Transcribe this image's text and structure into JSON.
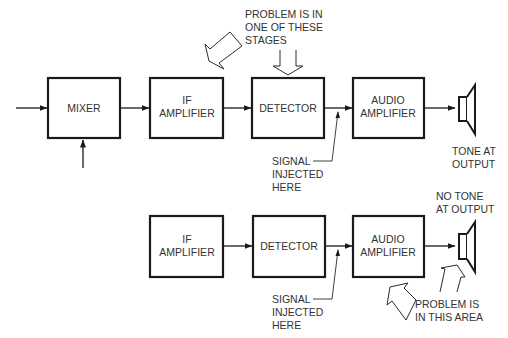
{
  "top_row": {
    "blocks": [
      {
        "id": "mixer",
        "lines": [
          "MIXER"
        ]
      },
      {
        "id": "if-amplifier",
        "lines": [
          "IF",
          "AMPLIFIER"
        ]
      },
      {
        "id": "detector",
        "lines": [
          "DETECTOR"
        ]
      },
      {
        "id": "audio-amplifier",
        "lines": [
          "AUDIO",
          "AMPLIFIER"
        ]
      }
    ],
    "problem_note": [
      "PROBLEM IS IN",
      "ONE OF THESE",
      "STAGES"
    ],
    "signal_note": [
      "SIGNAL",
      "INJECTED",
      "HERE"
    ],
    "output_note": [
      "TONE AT",
      "OUTPUT"
    ]
  },
  "bottom_row": {
    "blocks": [
      {
        "id": "if-amplifier",
        "lines": [
          "IF",
          "AMPLIFIER"
        ]
      },
      {
        "id": "detector",
        "lines": [
          "DETECTOR"
        ]
      },
      {
        "id": "audio-amplifier",
        "lines": [
          "AUDIO",
          "AMPLIFIER"
        ]
      }
    ],
    "signal_note": [
      "SIGNAL",
      "INJECTED",
      "HERE"
    ],
    "output_note": [
      "NO TONE",
      "AT OUTPUT"
    ],
    "problem_note": [
      "PROBLEM IS",
      "IN THIS AREA"
    ]
  },
  "colors": {
    "line": "#1a1a1a",
    "text": "#333333",
    "background": "#ffffff"
  }
}
